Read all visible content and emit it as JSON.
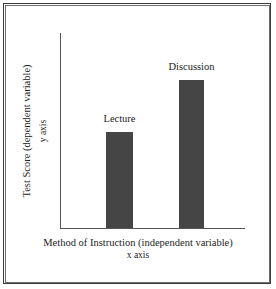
{
  "chart_data": {
    "type": "bar",
    "title": "",
    "categories": [
      "Lecture",
      "Discussion"
    ],
    "values": [
      49,
      76
    ],
    "value_unit": "percent-of-axis",
    "data_labels": [
      "Lecture",
      "Discussion"
    ],
    "xlabel": "Method of Instruction (independent variable)",
    "xlabel_sub": "x axis",
    "ylabel": "Test Score (dependent variable)",
    "ylabel_sub": "y axis",
    "xtick_labels": [],
    "ytick_labels": [],
    "ylim": [
      0,
      100
    ],
    "grid": false,
    "legend": false,
    "legend_position": "none",
    "bar_color": "#454545",
    "axis_color": "#555555",
    "background": "#ffffff",
    "frame_color": "#3a3a3a"
  }
}
